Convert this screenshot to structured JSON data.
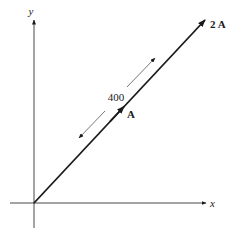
{
  "diagram": {
    "axes": {
      "x_label": "x",
      "y_label": "y"
    },
    "vectors": {
      "resultant_label": "2 A",
      "component_label": "A"
    },
    "dimension": {
      "value": "400"
    },
    "colors": {
      "ink": "#1a1a1a",
      "background": "#ffffff"
    }
  }
}
